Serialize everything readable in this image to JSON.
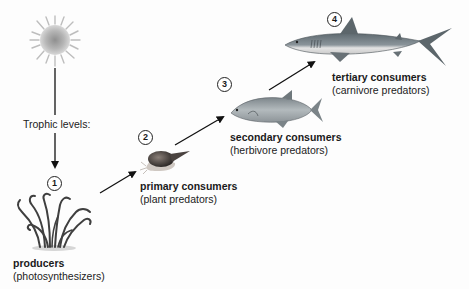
{
  "diagram": {
    "title_label": "Trophic levels:",
    "levels": [
      {
        "number": "1",
        "name": "producers",
        "description": "(photosynthesizers)",
        "organism": "seaweed"
      },
      {
        "number": "2",
        "name": "primary consumers",
        "description": "(plant predators)",
        "organism": "snail"
      },
      {
        "number": "3",
        "name": "secondary consumers",
        "description": "(herbivore predators)",
        "organism": "fish"
      },
      {
        "number": "4",
        "name": "tertiary consumers",
        "description": "(carnivore predators)",
        "organism": "shark"
      }
    ],
    "energy_source": "sun"
  }
}
